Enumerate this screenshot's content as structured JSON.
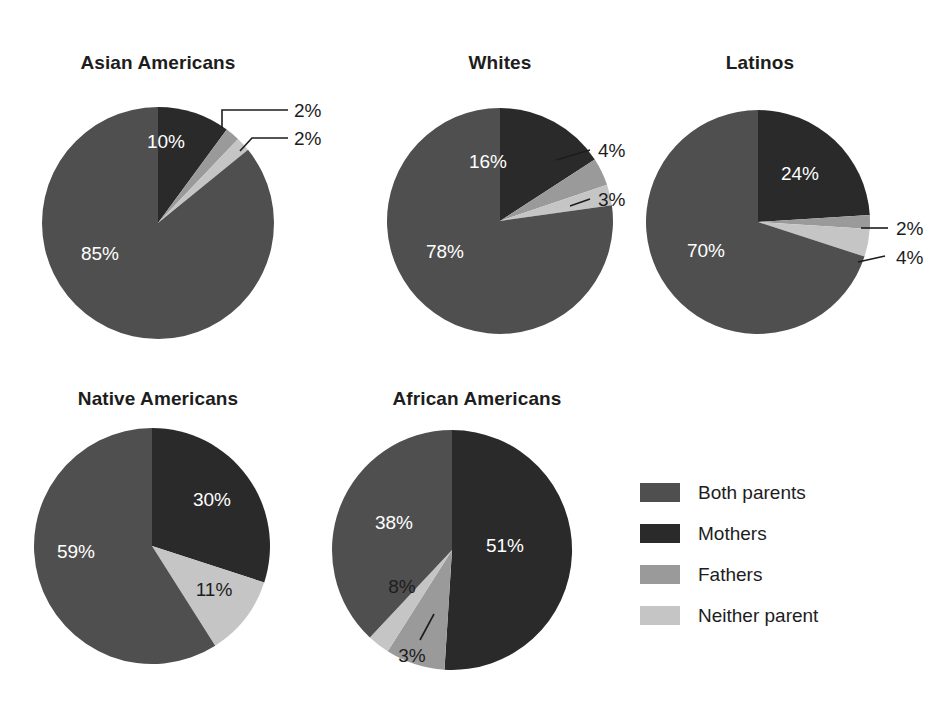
{
  "chart_data": {
    "type": "pie",
    "title": "",
    "legend_position": "bottom-right",
    "categories": [
      "Both parents",
      "Mothers",
      "Fathers",
      "Neither parent"
    ],
    "colors": {
      "both_parents": "#4f4f4f",
      "mothers": "#2a2a2a",
      "fathers": "#9a9a9a",
      "neither_parent": "#c5c5c5",
      "background": "#ffffff",
      "text": "#1d1d1d",
      "label_on_dark": "#ffffff"
    },
    "charts": [
      {
        "title": "Asian Americans",
        "values": [
          85,
          10,
          2,
          2
        ],
        "labels": [
          "85%",
          "10%",
          "2%",
          "2%"
        ]
      },
      {
        "title": "Whites",
        "values": [
          78,
          16,
          4,
          3
        ],
        "labels": [
          "78%",
          "16%",
          "4%",
          "3%"
        ]
      },
      {
        "title": "Latinos",
        "values": [
          70,
          24,
          2,
          4
        ],
        "labels": [
          "70%",
          "24%",
          "2%",
          "4%"
        ]
      },
      {
        "title": "Native Americans",
        "values": [
          59,
          30,
          0,
          11
        ],
        "labels": [
          "59%",
          "30%",
          "",
          "11%"
        ]
      },
      {
        "title": "African Americans",
        "values": [
          38,
          51,
          8,
          3
        ],
        "labels": [
          "38%",
          "51%",
          "8%",
          "3%"
        ]
      }
    ]
  },
  "charts": {
    "asian_americans": {
      "title": "Asian Americans",
      "both_parents": "85%",
      "mothers": "10%",
      "fathers": "2%",
      "neither_parent": "2%"
    },
    "whites": {
      "title": "Whites",
      "both_parents": "78%",
      "mothers": "16%",
      "fathers": "4%",
      "neither_parent": "3%"
    },
    "latinos": {
      "title": "Latinos",
      "both_parents": "70%",
      "mothers": "24%",
      "fathers": "2%",
      "neither_parent": "4%"
    },
    "native_americans": {
      "title": "Native Americans",
      "both_parents": "59%",
      "mothers": "30%",
      "neither_parent": "11%"
    },
    "african_americans": {
      "title": "African Americans",
      "both_parents": "38%",
      "mothers": "51%",
      "fathers": "8%",
      "neither_parent": "3%"
    }
  },
  "legend": {
    "items": [
      {
        "label": "Both parents",
        "color": "#4f4f4f"
      },
      {
        "label": "Mothers",
        "color": "#2a2a2a"
      },
      {
        "label": "Fathers",
        "color": "#9a9a9a"
      },
      {
        "label": "Neither parent",
        "color": "#c5c5c5"
      }
    ]
  }
}
